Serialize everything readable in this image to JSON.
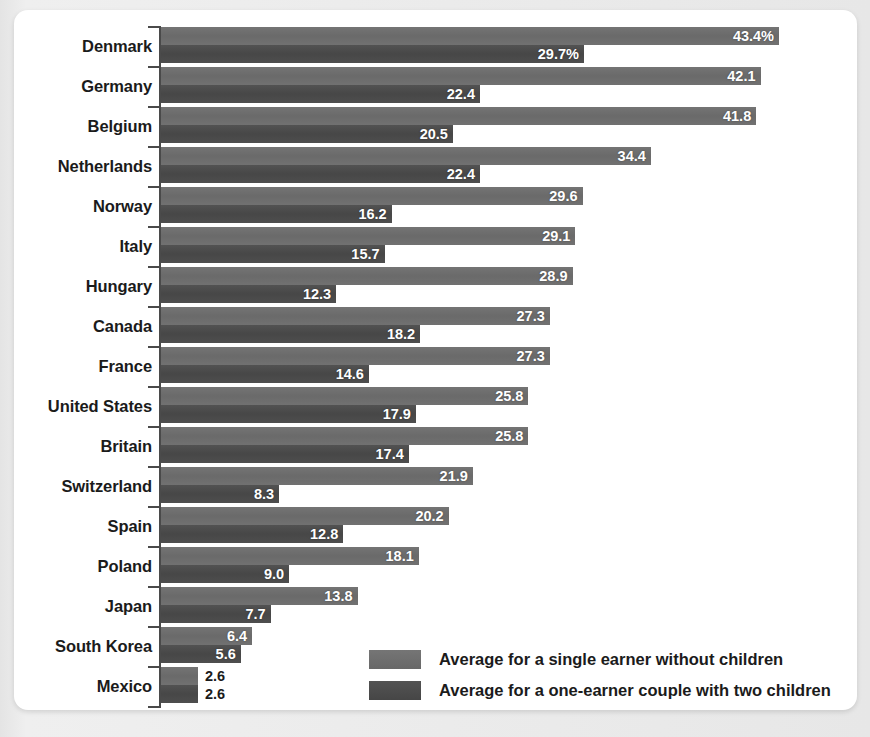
{
  "chart_data": {
    "type": "bar",
    "orientation": "horizontal",
    "title": "",
    "subtitle": "",
    "xlabel": "",
    "ylabel": "",
    "grid": false,
    "xlim": [
      0,
      48
    ],
    "unit": "%",
    "value_suffix_first_row": "%",
    "legend_position": "bottom-right",
    "categories": [
      "Denmark",
      "Germany",
      "Belgium",
      "Netherlands",
      "Norway",
      "Italy",
      "Hungary",
      "Canada",
      "France",
      "United States",
      "Britain",
      "Switzerland",
      "Spain",
      "Poland",
      "Japan",
      "South Korea",
      "Mexico"
    ],
    "series": [
      {
        "name": "Average for a single earner without children",
        "color": "#6d6d6d",
        "values": [
          43.4,
          42.1,
          41.8,
          34.4,
          29.6,
          29.1,
          28.9,
          27.3,
          27.3,
          25.8,
          25.8,
          21.9,
          20.2,
          18.1,
          13.8,
          6.4,
          2.6
        ],
        "labels": [
          "43.4%",
          "42.1",
          "41.8",
          "34.4",
          "29.6",
          "29.1",
          "28.9",
          "27.3",
          "27.3",
          "25.8",
          "25.8",
          "21.9",
          "20.2",
          "18.1",
          "13.8",
          "6.4",
          "2.6"
        ]
      },
      {
        "name": "Average for a one-earner couple with two children",
        "color": "#4b4b4b",
        "values": [
          29.7,
          22.4,
          20.5,
          22.4,
          16.2,
          15.7,
          12.3,
          18.2,
          14.6,
          17.9,
          17.4,
          8.3,
          12.8,
          9.0,
          7.7,
          5.6,
          2.6
        ],
        "labels": [
          "29.7%",
          "22.4",
          "20.5",
          "22.4",
          "16.2",
          "15.7",
          "12.3",
          "18.2",
          "14.6",
          "17.9",
          "17.4",
          "8.3",
          "12.8",
          "9.0",
          "7.7",
          "5.6",
          "2.6"
        ]
      }
    ]
  },
  "legend": {
    "items": [
      {
        "label": "Average for a single earner without children",
        "color": "#6d6d6d"
      },
      {
        "label": "Average for a one-earner couple with two children",
        "color": "#4b4b4b"
      }
    ]
  },
  "colors": {
    "series1": "#6d6d6d",
    "series2": "#4b4b4b",
    "card_background": "#ffffff",
    "page_background": "#e9e9e9",
    "axis": "#4a4a4a",
    "text": "#1b1b1b",
    "value_text": "#ffffff"
  }
}
